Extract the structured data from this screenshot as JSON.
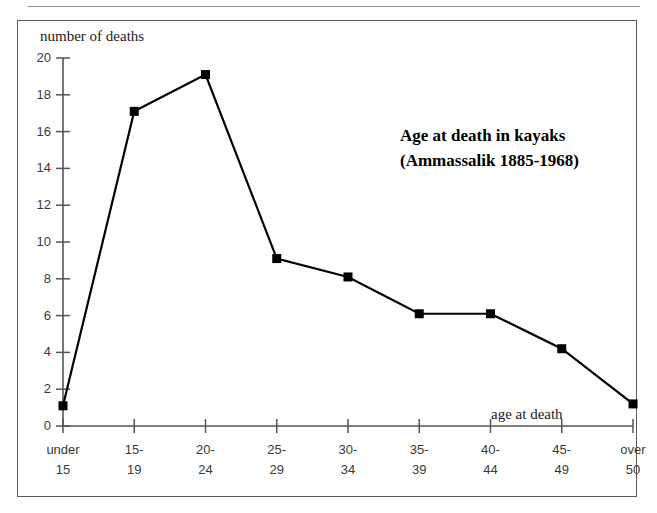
{
  "chart_data": {
    "type": "line",
    "title": "Age at death in kayaks",
    "subtitle": "(Ammassalik 1885-1968)",
    "xlabel": "age at death",
    "ylabel": "number of deaths",
    "categories": [
      "under 15",
      "15-19",
      "20-24",
      "25-29",
      "30-34",
      "35-39",
      "40-44",
      "45-49",
      "over 50"
    ],
    "category_lines": [
      [
        "under",
        "15"
      ],
      [
        "15-",
        "19"
      ],
      [
        "20-",
        "24"
      ],
      [
        "25-",
        "29"
      ],
      [
        "30-",
        "34"
      ],
      [
        "35-",
        "39"
      ],
      [
        "40-",
        "44"
      ],
      [
        "45-",
        "49"
      ],
      [
        "over",
        "50"
      ]
    ],
    "values": [
      1.1,
      17.1,
      19.1,
      9.1,
      8.1,
      6.1,
      6.1,
      4.2,
      1.2
    ],
    "ylim": [
      0,
      20
    ],
    "ytick_values": [
      0,
      2,
      4,
      6,
      8,
      10,
      12,
      14,
      16,
      18,
      20
    ],
    "ytick_labels": [
      "0",
      "2",
      "4",
      "6",
      "8",
      "10",
      "12",
      "14",
      "16",
      "18",
      "20"
    ],
    "grid": false,
    "legend": "none",
    "marker": "square",
    "line_color": "#000000",
    "marker_color": "#000000",
    "axis_color": "#555555",
    "frame_color": "#5a5a5a"
  }
}
